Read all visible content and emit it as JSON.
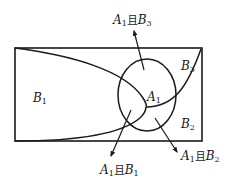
{
  "diagram": {
    "type": "venn-partition",
    "regions": {
      "b1": {
        "letter": "B",
        "sub": "1"
      },
      "b2": {
        "letter": "B",
        "sub": "2"
      },
      "b3": {
        "letter": "B",
        "sub": "3"
      },
      "a1": {
        "letter": "A",
        "sub": "1"
      }
    },
    "callouts": {
      "a1_and_b3": {
        "a": "A",
        "a_sub": "1",
        "conj": "且",
        "b": "B",
        "b_sub": "3"
      },
      "a1_and_b1": {
        "a": "A",
        "a_sub": "1",
        "conj": "且",
        "b": "B",
        "b_sub": "1"
      },
      "a1_and_b2": {
        "a": "A",
        "a_sub": "1",
        "conj": "且",
        "b": "B",
        "b_sub": "2"
      }
    },
    "stroke_color": "#1a1a1a"
  }
}
